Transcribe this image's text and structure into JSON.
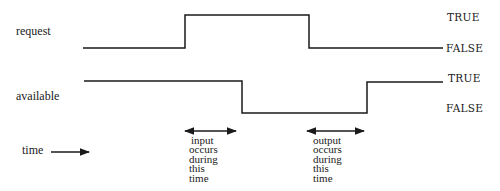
{
  "signals": [
    {
      "name": "request",
      "true_label": "TRUE",
      "false_label": "FALSE",
      "waveform": [
        [
          83,
          48
        ],
        [
          185,
          48
        ],
        [
          185,
          15
        ],
        [
          309,
          15
        ],
        [
          309,
          48
        ],
        [
          443,
          48
        ]
      ]
    },
    {
      "name": "available",
      "true_label": "TRUE",
      "false_label": "FALSE",
      "waveform": [
        [
          84,
          81
        ],
        [
          242,
          81
        ],
        [
          242,
          113
        ],
        [
          367,
          113
        ],
        [
          367,
          82
        ],
        [
          443,
          82
        ]
      ]
    }
  ],
  "time_axis": {
    "label": "time"
  },
  "annotations": [
    {
      "name": "input-window",
      "lines": [
        "input",
        "occurs",
        "during",
        "this",
        "time"
      ]
    },
    {
      "name": "output-window",
      "lines": [
        "output",
        "occurs",
        "during",
        "this",
        "time"
      ]
    }
  ],
  "colors": {
    "line": "#1a1a1a",
    "background": "#ffffff"
  }
}
